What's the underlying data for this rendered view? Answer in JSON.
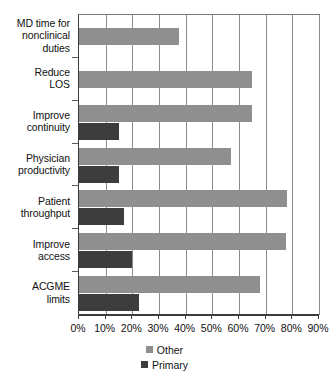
{
  "chart_data": {
    "type": "bar",
    "orientation": "horizontal",
    "title": "",
    "xlabel": "",
    "ylabel": "",
    "xlim": [
      0,
      90
    ],
    "grid": true,
    "legend_position": "bottom-center",
    "categories": [
      "MD time for nonclinical duties",
      "Reduce LOS",
      "Improve continuity",
      "Physician productivity",
      "Patient throughput",
      "Improve access",
      "ACGME limits"
    ],
    "category_lines": [
      [
        "MD time for",
        "nonclinical",
        "duties"
      ],
      [
        "Reduce",
        "LOS"
      ],
      [
        "Improve",
        "continuity"
      ],
      [
        "Physician",
        "productivity"
      ],
      [
        "Patient",
        "throughput"
      ],
      [
        "Improve",
        "access"
      ],
      [
        "ACGME",
        "limits"
      ]
    ],
    "tick_labels": [
      "0%",
      "10%",
      "20%",
      "30%",
      "40%",
      "50%",
      "60%",
      "70%",
      "80%",
      "90%"
    ],
    "tick_values": [
      0,
      10,
      20,
      30,
      40,
      50,
      60,
      70,
      80,
      90
    ],
    "series": [
      {
        "name": "Other",
        "color": "#8f8f8f",
        "values": [
          37.5,
          65,
          65,
          57,
          78,
          77.5,
          68
        ]
      },
      {
        "name": "Primary",
        "color": "#3d3d3d",
        "values": [
          0,
          0,
          15,
          15,
          17,
          20,
          22.5
        ]
      }
    ]
  },
  "legend": {
    "items": [
      {
        "label": "Other",
        "swatch": "other"
      },
      {
        "label": "Primary",
        "swatch": "primary"
      }
    ]
  }
}
